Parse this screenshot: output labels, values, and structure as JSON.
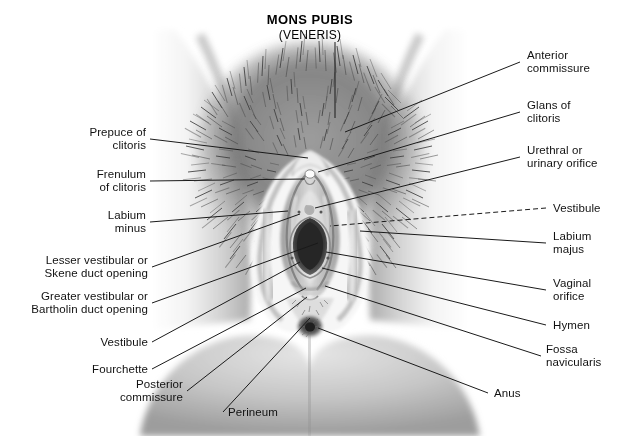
{
  "figure": {
    "title_main": "MONS PUBIS",
    "title_sub": "(VENERIS)",
    "style": "grayscale medical illustration",
    "background_color": "#ffffff",
    "line_color": "#1a1a1a",
    "text_color": "#111111"
  },
  "labels_left": [
    {
      "id": "prepuce-of-clitoris",
      "text": "Prepuce of\nclitoris"
    },
    {
      "id": "frenulum-of-clitoris",
      "text": "Frenulum\nof clitoris"
    },
    {
      "id": "labium-minus",
      "text": "Labium\nminus"
    },
    {
      "id": "lesser-vestibular-skene",
      "text": "Lesser vestibular or\nSkene duct opening"
    },
    {
      "id": "greater-vestibular-bartholin",
      "text": "Greater vestibular or\nBartholin duct opening"
    },
    {
      "id": "vestibule-left",
      "text": "Vestibule"
    },
    {
      "id": "fourchette",
      "text": "Fourchette"
    },
    {
      "id": "posterior-commissure",
      "text": "Posterior\ncommissure"
    }
  ],
  "labels_right": [
    {
      "id": "anterior-commissure",
      "text": "Anterior\ncommissure"
    },
    {
      "id": "glans-of-clitoris",
      "text": "Glans of\nclitoris"
    },
    {
      "id": "urethral-orifice",
      "text": "Urethral or\nurinary orifice"
    },
    {
      "id": "vestibule-right",
      "text": "Vestibule"
    },
    {
      "id": "labium-majus",
      "text": "Labium\nmajus"
    },
    {
      "id": "vaginal-orifice",
      "text": "Vaginal\norifice"
    },
    {
      "id": "hymen",
      "text": "Hymen"
    },
    {
      "id": "fossa-navicularis",
      "text": "Fossa\nnavicularis"
    },
    {
      "id": "anus",
      "text": "Anus"
    }
  ],
  "labels_bottom": [
    {
      "id": "perineum",
      "text": "Perineum"
    }
  ]
}
